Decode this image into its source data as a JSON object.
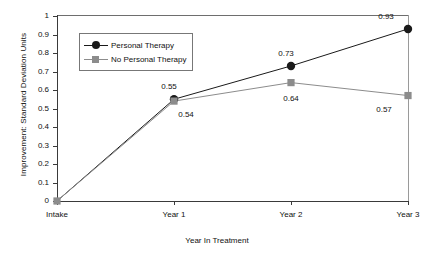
{
  "chart_data": {
    "type": "line",
    "title": "",
    "xlabel": "Year In Treatment",
    "ylabel": "Improvement: Standard Deviation Units",
    "categories": [
      "Intake",
      "Year 1",
      "Year 2",
      "Year 3"
    ],
    "ylim": [
      0,
      1
    ],
    "yticks": [
      "0",
      "0.1",
      "0.2",
      "0.3",
      "0.4",
      "0.5",
      "0.6",
      "0.7",
      "0.8",
      "0.9",
      "1"
    ],
    "ytick_values": [
      0,
      0.1,
      0.2,
      0.3,
      0.4,
      0.5,
      0.6,
      0.7,
      0.8,
      0.9,
      1
    ],
    "grid": false,
    "legend_position": "upper-left-inside",
    "series": [
      {
        "name": "Personal Therapy",
        "values": [
          0,
          0.55,
          0.73,
          0.93
        ],
        "labels": [
          "",
          "0.55",
          "0.73",
          "0.93"
        ],
        "color": "#1a1a1a",
        "marker": "circle"
      },
      {
        "name": "No Personal Therapy",
        "values": [
          0,
          0.54,
          0.64,
          0.57
        ],
        "labels": [
          "",
          "0.54",
          "0.64",
          "0.57"
        ],
        "color": "#8c8c8c",
        "marker": "square"
      }
    ]
  },
  "axes": {
    "y_title": "Improvement: Standard Deviation Units",
    "x_title": "Year In Treatment",
    "y_tick_labels": [
      "1",
      "0.9",
      "0.8",
      "0.7",
      "0.6",
      "0.5",
      "0.4",
      "0.3",
      "0.2",
      "0.1",
      "0"
    ],
    "x_tick_labels": [
      "Intake",
      "Year 1",
      "Year 2",
      "Year 3"
    ]
  },
  "legend": {
    "entries": [
      {
        "label": "Personal Therapy"
      },
      {
        "label": "No Personal Therapy"
      }
    ]
  },
  "data_labels": {
    "year1_personal": "0.55",
    "year1_no_personal": "0.54",
    "year2_personal": "0.73",
    "year2_no_personal": "0.64",
    "year3_personal": "0.93",
    "year3_no_personal": "0.57"
  },
  "colors": {
    "personal_therapy": "#1a1a1a",
    "no_personal_therapy": "#8c8c8c",
    "axis": "#3a3a3a",
    "background": "#ffffff"
  }
}
